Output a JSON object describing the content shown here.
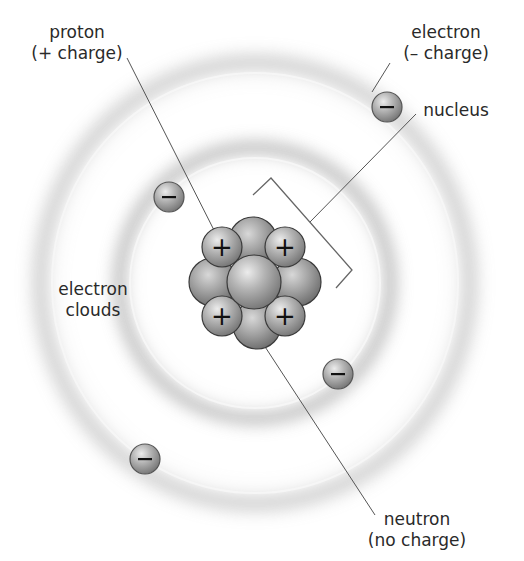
{
  "diagram": {
    "labels": {
      "proton": {
        "line1": "proton",
        "line2": "(+ charge)"
      },
      "electron": {
        "line1": "electron",
        "line2": "(– charge)"
      },
      "nucleus": {
        "line1": "nucleus"
      },
      "electron_clouds": {
        "line1": "electron",
        "line2": "clouds"
      },
      "neutron": {
        "line1": "neutron",
        "line2": "(no charge)"
      }
    },
    "symbols": {
      "electron": "–",
      "proton": "+"
    },
    "colors": {
      "background": "#ffffff",
      "particle_fill": "#a8a8a8",
      "particle_highlight": "#e6e6e6",
      "particle_shadow": "#6e6e6e",
      "orbit_line": "#f4f4f4",
      "cloud_shadow": "#9a9a9a",
      "leader_line": "#555555",
      "text": "#2a2a2a"
    },
    "electrons_count": 4,
    "protons_count": 4,
    "orbits_count": 2
  }
}
